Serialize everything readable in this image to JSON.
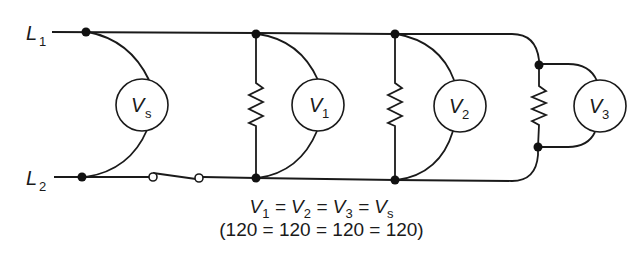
{
  "diagram": {
    "lines": [
      {
        "id": "L1",
        "label": "L",
        "subscript": "1"
      },
      {
        "id": "L2",
        "label": "L",
        "subscript": "2"
      }
    ],
    "meters": [
      {
        "id": "Vs",
        "label": "V",
        "subscript": "s"
      },
      {
        "id": "V1",
        "label": "V",
        "subscript": "1"
      },
      {
        "id": "V2",
        "label": "V",
        "subscript": "2"
      },
      {
        "id": "V3",
        "label": "V",
        "subscript": "3"
      }
    ],
    "components": [
      "source voltmeter Vs",
      "switch",
      "resistor R1 with voltmeter V1",
      "resistor R2 with voltmeter V2",
      "resistor R3 with voltmeter V3"
    ],
    "equation": {
      "symbolic": [
        "V1",
        "V2",
        "V3",
        "Vs"
      ],
      "symbolic_text": "V1 = V2 = V3 = Vs",
      "numeric": "(120 = 120 = 120 = 120)"
    },
    "colors": {
      "line": "#1a1a1a",
      "background": "#ffffff"
    }
  }
}
